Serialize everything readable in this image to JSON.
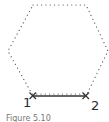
{
  "diagram": {
    "shape": "hexagon",
    "hexagon_style": "dotted",
    "vertices": [
      [
        33,
        5
      ],
      [
        86,
        5
      ],
      [
        108,
        51
      ],
      [
        87,
        94
      ],
      [
        32,
        94
      ],
      [
        8,
        51
      ]
    ],
    "edge": {
      "from": "1",
      "to": "2",
      "style": "solid"
    },
    "points": [
      {
        "label": "1",
        "x": 32,
        "y": 96,
        "marker": "x"
      },
      {
        "label": "2",
        "x": 86,
        "y": 96,
        "marker": "x"
      }
    ],
    "colors": {
      "line": "#333333",
      "dots": "#555555"
    }
  },
  "caption": "Figure 5.10"
}
